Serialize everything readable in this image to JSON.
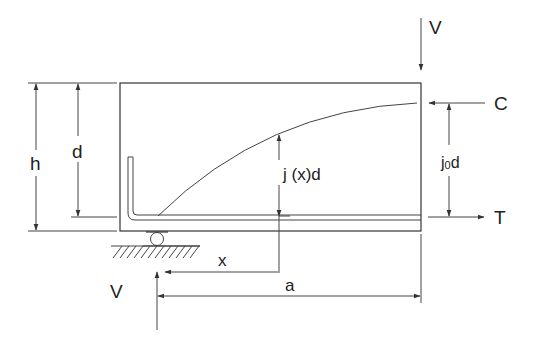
{
  "diagram": {
    "colors": {
      "line": "#333333",
      "background": "#ffffff"
    },
    "labels": {
      "shear_top": "V",
      "shear_bottom": "V",
      "compression": "C",
      "tension": "T",
      "height": "h",
      "effective_depth": "d",
      "lever_arm_x": "j (x)d",
      "lever_arm_0_j": "j",
      "lever_arm_0_sub": "0",
      "lever_arm_0_d": "d",
      "distance_x": "x",
      "shear_span": "a"
    }
  }
}
